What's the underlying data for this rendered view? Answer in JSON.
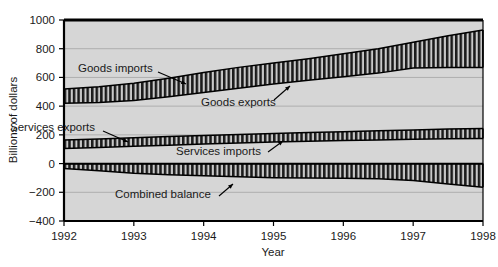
{
  "chart_data": {
    "type": "area",
    "title": "",
    "xlabel": "Year",
    "ylabel": "Billions of dollars",
    "xlim": [
      1992,
      1998
    ],
    "ylim": [
      -400,
      1000
    ],
    "ytick_labels": [
      "1000",
      "800",
      "600",
      "400",
      "200",
      "0",
      "−200",
      "−400"
    ],
    "ytick_values": [
      1000,
      800,
      600,
      400,
      200,
      0,
      -200,
      -400
    ],
    "xtick_labels": [
      "1992",
      "1993",
      "1994",
      "1995",
      "1996",
      "1997",
      "1998"
    ],
    "xtick_values": [
      1992,
      1993,
      1994,
      1995,
      1996,
      1997,
      1998
    ],
    "grid": true,
    "legend": "annotations-inline",
    "x": [
      1992,
      1992.5,
      1993,
      1993.5,
      1994,
      1994.5,
      1995,
      1995.5,
      1996,
      1996.5,
      1997,
      1997.5,
      1998
    ],
    "series": [
      {
        "name": "Goods imports",
        "values": [
          520,
          535,
          560,
          595,
          635,
          670,
          700,
          730,
          765,
          800,
          845,
          890,
          930
        ]
      },
      {
        "name": "Goods exports",
        "values": [
          420,
          425,
          440,
          465,
          495,
          525,
          555,
          580,
          605,
          630,
          665,
          670,
          670
        ]
      },
      {
        "name": "Services exports",
        "values": [
          165,
          172,
          180,
          188,
          196,
          203,
          210,
          216,
          222,
          228,
          234,
          240,
          245
        ]
      },
      {
        "name": "Services imports",
        "values": [
          105,
          112,
          120,
          128,
          136,
          143,
          150,
          155,
          160,
          165,
          170,
          173,
          175
        ]
      },
      {
        "name": "Combined balance",
        "values": [
          -35,
          -50,
          -68,
          -78,
          -85,
          -92,
          -98,
          -100,
          -102,
          -105,
          -118,
          -142,
          -165
        ]
      }
    ],
    "bands": [
      {
        "name": "goods-band",
        "upper": "Goods imports",
        "lower": "Goods exports"
      },
      {
        "name": "services-band",
        "upper": "Services exports",
        "lower": "Services imports"
      },
      {
        "name": "balance-band",
        "upper": "zero",
        "lower": "Combined balance"
      }
    ],
    "annotations": [
      {
        "name": "goods-imports-label",
        "text": "Goods imports",
        "x": 78,
        "y": 72,
        "arrow_from": [
          158,
          72
        ],
        "arrow_to": [
          186,
          84
        ]
      },
      {
        "name": "goods-exports-label",
        "text": "Goods exports",
        "x": 201,
        "y": 106,
        "arrow_from": [
          274,
          100
        ],
        "arrow_to": [
          290,
          86
        ]
      },
      {
        "name": "services-exports-label",
        "text": "Services exports",
        "x": 10,
        "y": 131,
        "arrow_from": [
          103,
          131
        ],
        "arrow_to": [
          128,
          142
        ]
      },
      {
        "name": "services-imports-label",
        "text": "Services imports",
        "x": 176,
        "y": 155,
        "arrow_from": [
          268,
          152
        ],
        "arrow_to": [
          283,
          141
        ]
      },
      {
        "name": "combined-balance-label",
        "text": "Combined balance",
        "x": 115,
        "y": 198,
        "arrow_from": [
          219,
          196
        ],
        "arrow_to": [
          233,
          184
        ]
      }
    ],
    "colors": {
      "plot_background": "#d6d6d6",
      "axis": "#000000",
      "gridline": "#aeaeae",
      "hatch": "#1a1a1a",
      "band_fill": "#c9c9c9",
      "text": "#1a1a1a",
      "page_background": "#ffffff"
    }
  }
}
